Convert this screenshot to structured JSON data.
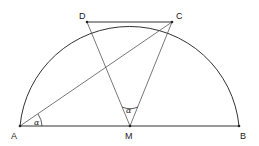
{
  "diagram": {
    "type": "semicircle-geometry",
    "points": {
      "A": {
        "label": "A",
        "x": 20,
        "y": 126
      },
      "M": {
        "label": "M",
        "x": 130,
        "y": 126
      },
      "B": {
        "label": "B",
        "x": 239,
        "y": 126
      },
      "C": {
        "label": "C",
        "x": 172,
        "y": 22
      },
      "D": {
        "label": "D",
        "x": 87,
        "y": 22
      }
    },
    "segments": [
      "AB",
      "DC",
      "AC",
      "MD",
      "MC"
    ],
    "arc": {
      "center": "M",
      "from": "A",
      "to": "B",
      "type": "semicircle"
    },
    "angles": [
      {
        "vertex": "A",
        "label": "α",
        "between": [
          "AB",
          "AC"
        ]
      },
      {
        "vertex": "M",
        "label": "α",
        "between": [
          "MD",
          "MC"
        ]
      }
    ]
  }
}
